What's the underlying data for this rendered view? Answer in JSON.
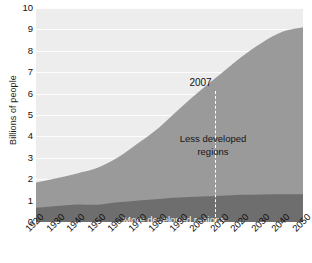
{
  "chart_data": {
    "type": "area",
    "title": "",
    "subtitle": "",
    "xlabel": "",
    "ylabel": "Billions of people",
    "stacked": true,
    "grid": true,
    "legend_position": "inline-annotations",
    "xlim": [
      1920,
      2050
    ],
    "ylim": [
      0,
      10
    ],
    "yticks": [
      10,
      9,
      8,
      7,
      6,
      5,
      4,
      3,
      2,
      1,
      0
    ],
    "x": [
      1920,
      1930,
      1940,
      1950,
      1960,
      1970,
      1980,
      1990,
      2000,
      2010,
      2020,
      2030,
      2040,
      2050
    ],
    "xticklabels": [
      "1920",
      "1930",
      "1940",
      "1950",
      "1960",
      "1970",
      "1980",
      "1990",
      "2000",
      "2010",
      "2020",
      "2030",
      "2040",
      "2050"
    ],
    "series": [
      {
        "name": "More developed regions",
        "color": "#6e6e6e",
        "label_color": "#f2f2f2",
        "values": [
          0.67,
          0.75,
          0.82,
          0.81,
          0.92,
          1.01,
          1.08,
          1.14,
          1.19,
          1.23,
          1.27,
          1.29,
          1.3,
          1.3
        ]
      },
      {
        "name": "Less developed regions",
        "color": "#9a9a9a",
        "label_color": "#151515",
        "values": [
          1.18,
          1.3,
          1.45,
          1.72,
          2.1,
          2.69,
          3.34,
          4.16,
          4.95,
          5.7,
          6.44,
          7.09,
          7.59,
          7.8
        ]
      }
    ],
    "totals": [
      1.85,
      2.05,
      2.27,
      2.53,
      3.02,
      3.7,
      4.42,
      5.3,
      6.14,
      6.93,
      7.71,
      8.38,
      8.89,
      9.1
    ],
    "annotations": [
      {
        "label": "2007",
        "x": 2007,
        "kind": "vertical-dashed-line",
        "line_color": "#ffffff"
      }
    ],
    "colors": {
      "plot_background": "#ededed",
      "gridline": "#fdfdfd",
      "more_developed": "#6e6e6e",
      "less_developed": "#9a9a9a",
      "text": "#111111"
    }
  },
  "labels": {
    "less_developed_line1": "Less developed",
    "less_developed_line2": "regions",
    "more_developed": "More developed regions"
  }
}
